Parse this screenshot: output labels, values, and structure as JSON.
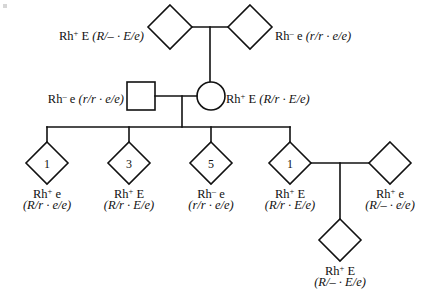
{
  "figure": {
    "kind": "pedigree-chart",
    "width": 446,
    "height": 294,
    "line_color": "#111111",
    "background": "#ffffff"
  },
  "generation_I": {
    "left": {
      "shape": "diamond",
      "cx": 170,
      "cy": 27,
      "r": 22,
      "label_line1": "Rh",
      "label_sup": "+",
      "label_line1_rest": " E ",
      "genotype": "(R/– · E/e)",
      "label_x": 144,
      "label_y": 33,
      "align": "right"
    },
    "right": {
      "shape": "diamond",
      "cx": 250,
      "cy": 27,
      "r": 22,
      "label_line1": "Rh",
      "label_sup": "–",
      "label_line1_rest": " e ",
      "genotype": "(r/r · e/e)",
      "label_x": 275,
      "label_y": 33,
      "align": "left"
    }
  },
  "generation_II": {
    "male": {
      "shape": "square",
      "cx": 141,
      "cy": 96,
      "size": 28,
      "label_line1": "Rh",
      "label_sup": "–",
      "label_line1_rest": " e ",
      "genotype": "(r/r · e/e)",
      "label_x": 124,
      "label_y": 89,
      "align": "right"
    },
    "female": {
      "shape": "circle",
      "cx": 211,
      "cy": 96,
      "r": 14,
      "label_line1": "Rh",
      "label_sup": "+",
      "label_line1_rest": " E ",
      "genotype": "(R/r · E/e)",
      "label_x": 226,
      "label_y": 89,
      "align": "left"
    }
  },
  "generation_III": {
    "siblings": [
      {
        "number": "1",
        "shape": "diamond",
        "cx": 47,
        "cy": 163,
        "r": 21,
        "phenotype_pre": "Rh",
        "phenotype_sup": "+",
        "phenotype_post": " e",
        "genotype": "(R/r · e/e)"
      },
      {
        "number": "3",
        "shape": "diamond",
        "cx": 129,
        "cy": 163,
        "r": 21,
        "phenotype_pre": "Rh",
        "phenotype_sup": "+",
        "phenotype_post": " E",
        "genotype": "(R/r · E/e)"
      },
      {
        "number": "5",
        "shape": "diamond",
        "cx": 211,
        "cy": 163,
        "r": 21,
        "phenotype_pre": "Rh",
        "phenotype_sup": "–",
        "phenotype_post": " e",
        "genotype": "(r/r · e/e)"
      },
      {
        "number": "1",
        "shape": "diamond",
        "cx": 290,
        "cy": 163,
        "r": 21,
        "phenotype_pre": "Rh",
        "phenotype_sup": "+",
        "phenotype_post": " E",
        "genotype": "(R/r · E/e)"
      }
    ],
    "mate": {
      "shape": "diamond",
      "cx": 390,
      "cy": 163,
      "r": 21,
      "number": "",
      "phenotype_pre": "Rh",
      "phenotype_sup": "+",
      "phenotype_post": " e",
      "genotype": "(R/– · e/e)"
    },
    "label_y_line1": 184,
    "label_y_line2": 198
  },
  "generation_IV": {
    "child": {
      "shape": "diamond",
      "cx": 340,
      "cy": 240,
      "r": 21,
      "phenotype_pre": "Rh",
      "phenotype_sup": "+",
      "phenotype_post": " E",
      "genotype": "(R/– · E/e)",
      "label_y_line1": 261,
      "label_y_line2": 275
    }
  },
  "connectors": {
    "gen1_mating_y": 27,
    "gen1_mating_x1": 192,
    "gen1_mating_x2": 228,
    "gen1_drop_x": 210,
    "gen1_drop_y2": 82,
    "gen2_mating_y": 96,
    "gen2_mating_x1": 155,
    "gen2_mating_x2": 197,
    "gen2_drop_x": 182,
    "sibship_y": 127,
    "sibship_x1": 47,
    "sibship_x2": 290,
    "gen3_mating_y": 163,
    "gen3_mating_x1": 311,
    "gen3_mating_x2": 369,
    "gen3_drop_x": 340,
    "gen3_drop_y2": 219
  }
}
